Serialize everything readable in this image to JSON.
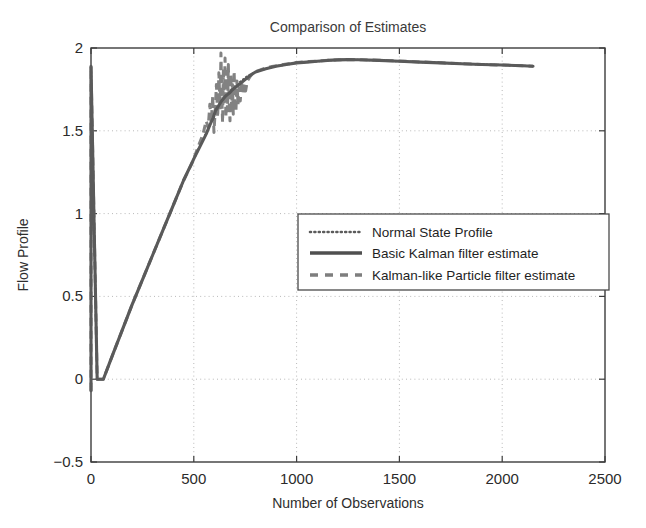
{
  "chart_data": {
    "type": "line",
    "title": "Comparison of Estimates",
    "xlabel": "Number of Observations",
    "ylabel": "Flow Profile",
    "xlim": [
      0,
      2500
    ],
    "ylim": [
      -0.5,
      2
    ],
    "xticks": [
      0,
      500,
      1000,
      1500,
      2000,
      2500
    ],
    "yticks": [
      -0.5,
      0,
      0.5,
      1,
      1.5,
      2
    ],
    "xtick_labels": [
      "0",
      "500",
      "1000",
      "1500",
      "2000",
      "2500"
    ],
    "ytick_labels": [
      "-0.5",
      "0",
      "0.5",
      "1",
      "1.5",
      "2"
    ],
    "grid": true,
    "grid_style": "dotted",
    "legend_position": "center-right",
    "series": [
      {
        "name": "Normal State Profile",
        "style": "dotted",
        "color": "#5b5b5b",
        "x": [
          0,
          0,
          0,
          30,
          60,
          100,
          150,
          200,
          250,
          300,
          350,
          400,
          450,
          500,
          550,
          580,
          600,
          620,
          640,
          660,
          680,
          700,
          720,
          740,
          760,
          800,
          850,
          900,
          950,
          1000,
          1050,
          1100,
          1150,
          1200,
          1250,
          1300,
          1400,
          1500,
          1600,
          1700,
          1800,
          1900,
          2000,
          2100,
          2150
        ],
        "y": [
          -0.07,
          0.95,
          1.89,
          0.0,
          0.0,
          0.13,
          0.29,
          0.45,
          0.6,
          0.75,
          0.9,
          1.05,
          1.2,
          1.33,
          1.46,
          1.54,
          1.6,
          1.64,
          1.68,
          1.71,
          1.74,
          1.77,
          1.79,
          1.81,
          1.83,
          1.855,
          1.875,
          1.89,
          1.9,
          1.91,
          1.915,
          1.92,
          1.925,
          1.928,
          1.93,
          1.929,
          1.925,
          1.92,
          1.915,
          1.91,
          1.905,
          1.9,
          1.897,
          1.893,
          1.89
        ]
      },
      {
        "name": "Basic Kalman filter estimate",
        "style": "solid",
        "color": "#5a5a5a",
        "x": [
          0,
          0,
          0,
          30,
          60,
          100,
          150,
          200,
          250,
          300,
          350,
          400,
          450,
          500,
          540,
          560,
          580,
          595,
          605,
          615,
          625,
          635,
          645,
          655,
          665,
          675,
          685,
          695,
          705,
          715,
          725,
          735,
          745,
          760,
          780,
          800,
          850,
          900,
          950,
          1000,
          1050,
          1100,
          1150,
          1200,
          1250,
          1300,
          1400,
          1500,
          1600,
          1700,
          1800,
          1900,
          2000,
          2100,
          2150
        ],
        "y": [
          -0.07,
          0.95,
          1.89,
          0.0,
          0.0,
          0.13,
          0.29,
          0.45,
          0.6,
          0.75,
          0.9,
          1.05,
          1.2,
          1.33,
          1.43,
          1.48,
          1.54,
          1.58,
          1.62,
          1.64,
          1.66,
          1.68,
          1.695,
          1.71,
          1.72,
          1.73,
          1.745,
          1.755,
          1.765,
          1.775,
          1.785,
          1.795,
          1.805,
          1.82,
          1.84,
          1.855,
          1.875,
          1.89,
          1.9,
          1.91,
          1.915,
          1.92,
          1.925,
          1.928,
          1.93,
          1.929,
          1.925,
          1.92,
          1.915,
          1.91,
          1.905,
          1.9,
          1.897,
          1.893,
          1.89
        ]
      },
      {
        "name": "Kalman-like Particle filter estimate",
        "style": "dashed",
        "color": "#828282",
        "x": [
          0,
          0,
          0,
          30,
          60,
          100,
          150,
          200,
          250,
          300,
          350,
          400,
          450,
          490,
          520,
          545,
          560,
          570,
          578,
          585,
          592,
          598,
          604,
          610,
          616,
          622,
          628,
          632,
          636,
          640,
          644,
          648,
          652,
          656,
          660,
          664,
          668,
          672,
          676,
          680,
          684,
          688,
          692,
          696,
          700,
          705,
          710,
          715,
          720,
          726,
          732,
          738,
          745,
          752,
          760,
          775,
          790,
          810,
          840,
          880,
          920,
          960,
          1000,
          1060,
          1120,
          1180,
          1250,
          1320,
          1400,
          1500,
          1600,
          1700,
          1800,
          1900,
          2000,
          2100,
          2150
        ],
        "y": [
          -0.07,
          0.95,
          1.89,
          0.0,
          0.0,
          0.13,
          0.29,
          0.45,
          0.6,
          0.75,
          0.9,
          1.05,
          1.2,
          1.3,
          1.4,
          1.48,
          1.56,
          1.52,
          1.66,
          1.55,
          1.71,
          1.49,
          1.62,
          1.78,
          1.58,
          1.85,
          1.63,
          1.97,
          1.72,
          1.55,
          1.88,
          1.66,
          1.94,
          1.58,
          1.82,
          1.62,
          1.9,
          1.68,
          1.56,
          1.84,
          1.64,
          1.78,
          1.6,
          1.86,
          1.7,
          1.62,
          1.8,
          1.66,
          1.76,
          1.68,
          1.8,
          1.72,
          1.78,
          1.74,
          1.8,
          1.83,
          1.85,
          1.862,
          1.875,
          1.888,
          1.897,
          1.905,
          1.912,
          1.918,
          1.923,
          1.927,
          1.93,
          1.929,
          1.926,
          1.921,
          1.916,
          1.911,
          1.906,
          1.901,
          1.897,
          1.893,
          1.89
        ]
      }
    ]
  },
  "legend": {
    "items": [
      {
        "label": "Normal State Profile"
      },
      {
        "label": "Basic Kalman filter estimate"
      },
      {
        "label": "Kalman-like Particle filter estimate"
      }
    ]
  }
}
